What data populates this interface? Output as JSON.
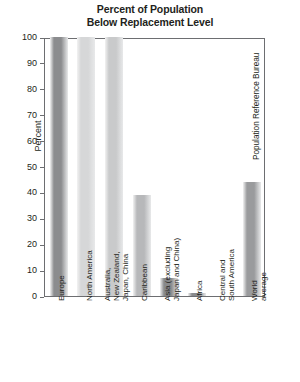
{
  "chart_data": {
    "type": "bar",
    "title": "Percent of Population\nBelow Replacement Level",
    "xlabel": "",
    "ylabel": "Percent",
    "ylim": [
      0,
      100
    ],
    "ytick_step": 10,
    "yticks": [
      100,
      90,
      80,
      70,
      60,
      50,
      40,
      30,
      20,
      10,
      0
    ],
    "grid": false,
    "legend": "none",
    "categories": [
      "Europe",
      "North America",
      "Australia,\nNew Zealand,\nJapan, China",
      "Caribbean",
      "Asia (excluding\nJapan and China)",
      "Africa",
      "Central and\nSouth America",
      "World average"
    ],
    "values": [
      100,
      100,
      100,
      39,
      7,
      1,
      0,
      44
    ],
    "bar_colors": [
      "#8b8c8e",
      "#d6d7d8",
      "#c9cacb",
      "#b7b8ba",
      "#88898b",
      "#8a8b8d",
      "#8a8b8d",
      "#9a9b9d"
    ]
  },
  "source": {
    "credit": "Population Reference Bureau"
  },
  "colors": {
    "axis": "#6d6e71",
    "text": "#231f20",
    "background": "#ffffff"
  }
}
